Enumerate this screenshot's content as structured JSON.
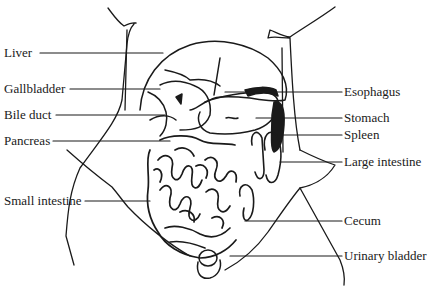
{
  "diagram": {
    "type": "anatomical-illustration",
    "colors": {
      "ink": "#1a1a1a",
      "background": "#ffffff"
    },
    "labels_left": [
      {
        "id": "liver",
        "text": "Liver",
        "y": 53,
        "line_end_x": 163
      },
      {
        "id": "gallbladder",
        "text": "Gallbladder",
        "y": 89,
        "line_end_x": 160
      },
      {
        "id": "bile-duct",
        "text": "Bile duct",
        "y": 115,
        "line_end_x": 165
      },
      {
        "id": "pancreas",
        "text": "Pancreas",
        "y": 141,
        "line_end_x": 170
      },
      {
        "id": "small-intestine",
        "text": "Small intestine",
        "y": 201,
        "line_end_x": 150
      }
    ],
    "labels_right": [
      {
        "id": "esophagus",
        "text": "Esophagus",
        "y": 92,
        "line_start_x": 225
      },
      {
        "id": "stomach",
        "text": "Stomach",
        "y": 118,
        "line_start_x": 256
      },
      {
        "id": "spleen",
        "text": "Spleen",
        "y": 135,
        "line_start_x": 278
      },
      {
        "id": "large-intestine",
        "text": "Large intestine",
        "y": 162,
        "line_start_x": 280
      },
      {
        "id": "cecum",
        "text": "Cecum",
        "y": 221,
        "line_start_x": 245
      },
      {
        "id": "urinary-bladder",
        "text": "Urinary bladder",
        "y": 256,
        "line_start_x": 230
      }
    ]
  }
}
